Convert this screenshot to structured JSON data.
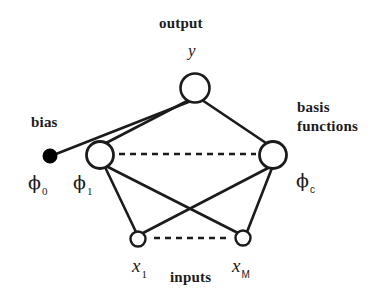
{
  "figure": {
    "kind": "neural-network-diagram",
    "title_visible": false,
    "background_color": "#ffffff",
    "stroke_color": "#1b1b1b",
    "node_fill": "#ffffff",
    "bias_fill": "#000000",
    "width": 373,
    "height": 301
  },
  "labels": {
    "output": "output",
    "output_symbol": "y",
    "bias": "bias",
    "basis_line1": "basis",
    "basis_line2": "functions",
    "inputs": "inputs"
  },
  "symbols": {
    "phi_0": {
      "base": "ϕ",
      "sub": "0"
    },
    "phi_1": {
      "base": "ϕ",
      "sub": "1"
    },
    "phi_c": {
      "base": "ϕ",
      "sub": "c"
    },
    "x_1": {
      "base": "x",
      "sub": "1"
    },
    "x_M": {
      "base": "x",
      "sub": "M"
    }
  },
  "nodes": [
    {
      "id": "output-y",
      "label": "y",
      "cx": 195,
      "cy": 88,
      "r": 14.5,
      "filled": false
    },
    {
      "id": "bias-node",
      "label": "phi_0",
      "cx": 50,
      "cy": 156,
      "r": 6.5,
      "filled": true
    },
    {
      "id": "hidden-phi-1",
      "label": "phi_1",
      "cx": 100,
      "cy": 155,
      "r": 13.5,
      "filled": false
    },
    {
      "id": "hidden-phi-c",
      "label": "phi_c",
      "cx": 273,
      "cy": 155,
      "r": 13.5,
      "filled": false
    },
    {
      "id": "input-x-1",
      "label": "x_1",
      "cx": 138,
      "cy": 239,
      "r": 7.5,
      "filled": false
    },
    {
      "id": "input-x-M",
      "label": "x_M",
      "cx": 243,
      "cy": 238,
      "r": 7.5,
      "filled": false
    }
  ],
  "edges": [
    {
      "from": "bias-node",
      "to": "output-y",
      "style": "solid"
    },
    {
      "from": "hidden-phi-1",
      "to": "output-y",
      "style": "solid"
    },
    {
      "from": "hidden-phi-c",
      "to": "output-y",
      "style": "solid"
    },
    {
      "from": "input-x-1",
      "to": "hidden-phi-1",
      "style": "solid"
    },
    {
      "from": "input-x-M",
      "to": "hidden-phi-1",
      "style": "solid"
    },
    {
      "from": "input-x-1",
      "to": "hidden-phi-c",
      "style": "solid"
    },
    {
      "from": "input-x-M",
      "to": "hidden-phi-c",
      "style": "solid"
    }
  ],
  "ellipses": [
    {
      "id": "hidden-layer-ellipsis",
      "x1": 119,
      "y1": 154,
      "x2": 256,
      "y2": 154
    },
    {
      "id": "input-layer-ellipsis",
      "x1": 154,
      "y1": 238,
      "x2": 228,
      "y2": 238
    }
  ]
}
